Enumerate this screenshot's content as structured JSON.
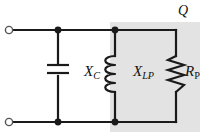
{
  "diagram": {
    "background_color": "#ffffff",
    "wire_color": "#1a1a1a",
    "shaded_region_color": "#e2e2e2",
    "terminal_fill": "#ffffff"
  },
  "labels": {
    "capacitor": {
      "symbol": "X",
      "subscript": "C",
      "full": "XC"
    },
    "inductor": {
      "symbol": "X",
      "subscript": "LP",
      "full": "XLP"
    },
    "resistor": {
      "symbol": "R",
      "subscript": "P",
      "full": "RP"
    },
    "quality_factor": {
      "text": "Q"
    }
  },
  "components": [
    {
      "name": "capacitor",
      "type": "capacitor",
      "label": "XC",
      "branch": "left"
    },
    {
      "name": "inductor",
      "type": "inductor",
      "label": "XLP",
      "branch": "middle"
    },
    {
      "name": "resistor",
      "type": "resistor",
      "label": "RP",
      "branch": "right"
    }
  ],
  "terminals": [
    {
      "name": "input-terminal-top",
      "x": 9,
      "y": 30
    },
    {
      "name": "input-terminal-bottom",
      "x": 9,
      "y": 122
    }
  ],
  "junctions": [
    {
      "name": "node-top-capacitor",
      "x": 58,
      "y": 30
    },
    {
      "name": "node-top-inductor",
      "x": 115,
      "y": 30
    },
    {
      "name": "node-bottom-capacitor",
      "x": 58,
      "y": 122
    },
    {
      "name": "node-bottom-inductor",
      "x": 115,
      "y": 122
    }
  ],
  "shaded_region": {
    "name": "q-region",
    "x": 110,
    "y": 22,
    "width": 90,
    "height": 110
  }
}
